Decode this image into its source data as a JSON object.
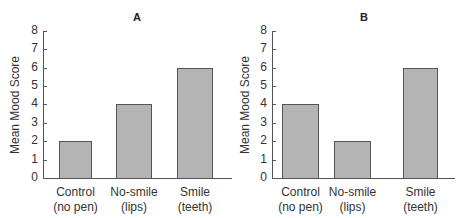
{
  "chart_data": [
    {
      "type": "bar",
      "title": "A",
      "categories": [
        "Control\n(no pen)",
        "No-smile\n(lips)",
        "Smile\n(teeth)"
      ],
      "category_lines": [
        [
          "Control",
          "(no pen)"
        ],
        [
          "No-smile",
          "(lips)"
        ],
        [
          "Smile",
          "(teeth)"
        ]
      ],
      "values": [
        2,
        4,
        6
      ],
      "xlabel": "",
      "ylabel": "Mean Mood Score",
      "ylim": [
        0,
        8
      ],
      "yticks": [
        "0",
        "1",
        "2",
        "3",
        "4",
        "5",
        "6",
        "7",
        "8"
      ],
      "grid": false,
      "bar_color": "#b4b4b4"
    },
    {
      "type": "bar",
      "title": "B",
      "categories": [
        "Control\n(no pen)",
        "No-smile\n(lips)",
        "Smile\n(teeth)"
      ],
      "category_lines": [
        [
          "Control",
          "(no pen)"
        ],
        [
          "No-smile",
          "(lips)"
        ],
        [
          "Smile",
          "(teeth)"
        ]
      ],
      "values": [
        4,
        2,
        6
      ],
      "xlabel": "",
      "ylabel": "Mean Mood Score",
      "ylim": [
        0,
        8
      ],
      "yticks": [
        "0",
        "1",
        "2",
        "3",
        "4",
        "5",
        "6",
        "7",
        "8"
      ],
      "grid": false,
      "bar_color": "#b4b4b4"
    }
  ],
  "panels": [
    {
      "title": "A",
      "ylabel": "Mean Mood Score",
      "yticks": [
        "0",
        "1",
        "2",
        "3",
        "4",
        "5",
        "6",
        "7",
        "8"
      ],
      "bars": [
        {
          "label1": "Control",
          "label2": "(no pen)",
          "value": 2
        },
        {
          "label1": "No-smile",
          "label2": "(lips)",
          "value": 4
        },
        {
          "label1": "Smile",
          "label2": "(teeth)",
          "value": 6
        }
      ]
    },
    {
      "title": "B",
      "ylabel": "Mean Mood Score",
      "yticks": [
        "0",
        "1",
        "2",
        "3",
        "4",
        "5",
        "6",
        "7",
        "8"
      ],
      "bars": [
        {
          "label1": "Control",
          "label2": "(no pen)",
          "value": 4
        },
        {
          "label1": "No-smile",
          "label2": "(lips)",
          "value": 2
        },
        {
          "label1": "Smile",
          "label2": "(teeth)",
          "value": 6
        }
      ]
    }
  ]
}
